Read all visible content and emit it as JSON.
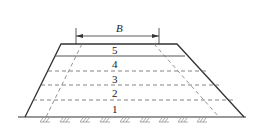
{
  "diagram": {
    "type": "embankment-layered-cross-section",
    "dimension": {
      "label": "B"
    },
    "layers": [
      {
        "id": 5,
        "label": "5"
      },
      {
        "id": 4,
        "label": "4"
      },
      {
        "id": 3,
        "label": "3"
      },
      {
        "id": 2,
        "label": "2"
      },
      {
        "id": 1,
        "label": "1"
      }
    ],
    "colors": {
      "stroke": "#333333",
      "dashed": "#666666",
      "background": "#ffffff"
    }
  }
}
